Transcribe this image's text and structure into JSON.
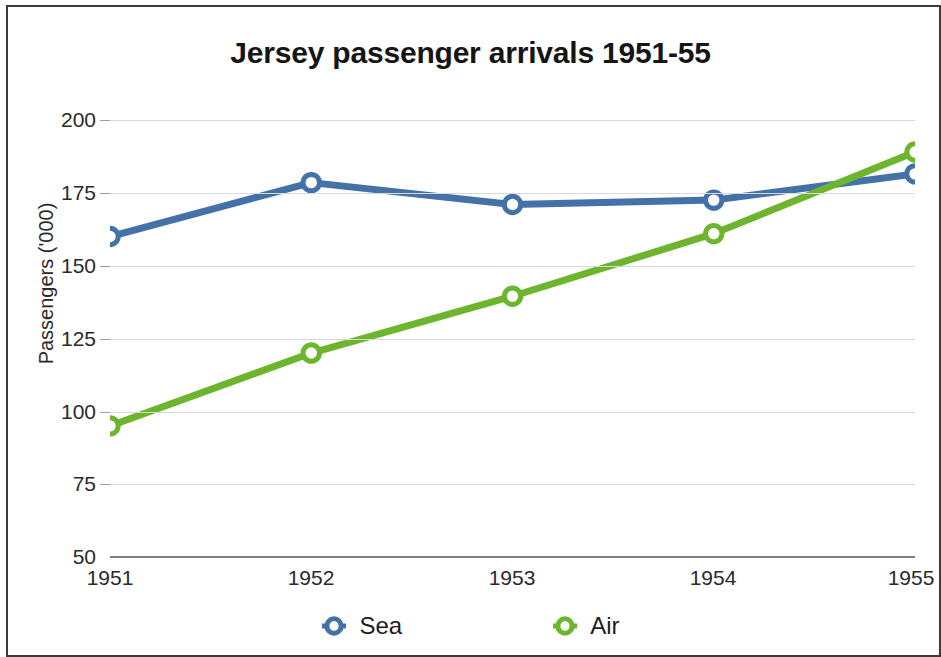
{
  "chart_data": {
    "type": "line",
    "title": "Jersey passenger arrivals 1951-55",
    "xlabel": "",
    "ylabel": "Passengers ('000)",
    "categories": [
      "1951",
      "1952",
      "1953",
      "1954",
      "1955"
    ],
    "x": [
      1951,
      1952,
      1953,
      1954,
      1955
    ],
    "ylim": [
      50,
      200
    ],
    "yticks": [
      50,
      75,
      100,
      125,
      150,
      175,
      200
    ],
    "grid": true,
    "legend_position": "bottom",
    "series": [
      {
        "name": "Sea",
        "color": "#4472a8",
        "marker": "open-circle",
        "values": [
          160,
          178.5,
          171,
          172.5,
          181.5
        ]
      },
      {
        "name": "Air",
        "color": "#6cb52d",
        "marker": "open-circle",
        "values": [
          95,
          120,
          139.5,
          161,
          189
        ]
      }
    ]
  },
  "axis": {
    "y_tick_labels": [
      "200",
      "175",
      "150",
      "125",
      "100",
      "75",
      "50"
    ],
    "x_tick_labels": [
      "1951",
      "1952",
      "1953",
      "1954",
      "1955"
    ],
    "y_axis_title": "Passengers ('000)"
  },
  "legend": {
    "items": [
      {
        "label": "Sea",
        "color": "#4472a8"
      },
      {
        "label": "Air",
        "color": "#6cb52d"
      }
    ]
  },
  "colors": {
    "sea": "#4472a8",
    "air": "#6cb52d",
    "gridline": "#d9d9d9",
    "axis": "#7f7f7f",
    "frame": "#3b3b3b",
    "text": "#2a2a2a",
    "title": "#151515"
  }
}
